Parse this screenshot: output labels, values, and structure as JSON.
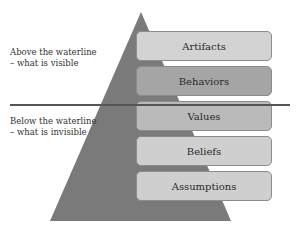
{
  "diagram": {
    "triangle": {
      "color": "#7a7a7a",
      "apex": [
        141,
        12
      ],
      "base_left": [
        50,
        221
      ],
      "base_right": [
        231,
        221
      ]
    },
    "waterline": {
      "color": "#555555"
    },
    "above": {
      "line1": "Above the waterline",
      "line2": "– what is visible"
    },
    "below": {
      "line1": "Below the waterline",
      "line2": "– what is invisible"
    },
    "layers": [
      {
        "label": "Artifacts",
        "fill": "#d3d3d3",
        "zone": "above"
      },
      {
        "label": "Behaviors",
        "fill": "#a5a5a5",
        "zone": "above"
      },
      {
        "label": "Values",
        "fill": "#bababa",
        "zone": "below"
      },
      {
        "label": "Beliefs",
        "fill": "#cfcfcf",
        "zone": "below"
      },
      {
        "label": "Assumptions",
        "fill": "#cfcfcf",
        "zone": "below"
      }
    ]
  }
}
